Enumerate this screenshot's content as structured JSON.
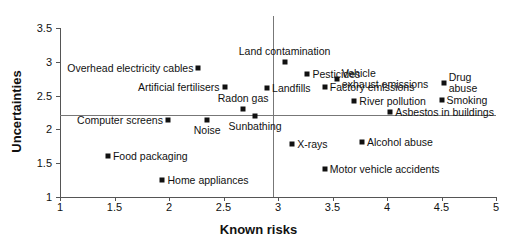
{
  "chart_data": {
    "type": "scatter",
    "title": "",
    "xlabel": "Known risks",
    "ylabel": "Uncertainties",
    "xlim": [
      1,
      5
    ],
    "ylim": [
      1,
      3.5
    ],
    "xticks": [
      "1",
      "1.5",
      "2",
      "2.5",
      "3",
      "3.5",
      "4",
      "4.5",
      "5"
    ],
    "xtick_values": [
      1,
      1.5,
      2,
      2.5,
      3,
      3.5,
      4,
      4.5,
      5
    ],
    "yticks": [
      "1",
      "1.5",
      "2",
      "2.5",
      "3",
      "3.5"
    ],
    "ytick_values": [
      1,
      1.5,
      2,
      2.5,
      3,
      3.5
    ],
    "grid": false,
    "legend": "none",
    "reference_lines": [
      {
        "orientation": "horizontal",
        "value": 2.21,
        "label": ""
      },
      {
        "orientation": "vertical",
        "value": 2.95,
        "label": ""
      }
    ],
    "points": [
      {
        "label": "Overhead electricity cables",
        "x": 2.27,
        "y": 2.91,
        "label_pos": "left"
      },
      {
        "label": "Artificial fertilisers",
        "x": 2.51,
        "y": 2.63,
        "label_pos": "left"
      },
      {
        "label": "Radon gas",
        "x": 2.68,
        "y": 2.3,
        "label_pos": "above"
      },
      {
        "label": "Sunbathing",
        "x": 2.79,
        "y": 2.2,
        "label_pos": "below"
      },
      {
        "label": "Computer screens",
        "x": 1.99,
        "y": 2.14,
        "label_pos": "left"
      },
      {
        "label": "Noise",
        "x": 2.35,
        "y": 2.14,
        "label_pos": "below"
      },
      {
        "label": "Food packaging",
        "x": 1.44,
        "y": 1.6,
        "label_pos": "right"
      },
      {
        "label": "Home appliances",
        "x": 1.94,
        "y": 1.25,
        "label_pos": "right"
      },
      {
        "label": "Land contamination",
        "x": 3.06,
        "y": 3.0,
        "label_pos": "above"
      },
      {
        "label": "Pesticides",
        "x": 3.27,
        "y": 2.82,
        "label_pos": "right"
      },
      {
        "label": "Vehicle exhaust emissions",
        "x": 3.54,
        "y": 2.74,
        "label_pos": "right-two"
      },
      {
        "label": "Drug abuse",
        "x": 4.52,
        "y": 2.68,
        "label_pos": "right-two"
      },
      {
        "label": "Landfills",
        "x": 2.9,
        "y": 2.61,
        "label_pos": "right"
      },
      {
        "label": "Factory emissions",
        "x": 3.43,
        "y": 2.62,
        "label_pos": "right"
      },
      {
        "label": "River pollution",
        "x": 3.7,
        "y": 2.42,
        "label_pos": "right"
      },
      {
        "label": "Smoking",
        "x": 4.5,
        "y": 2.44,
        "label_pos": "right"
      },
      {
        "label": "Asbestos in buildings",
        "x": 4.03,
        "y": 2.26,
        "label_pos": "right"
      },
      {
        "label": "X-rays",
        "x": 3.13,
        "y": 1.78,
        "label_pos": "right"
      },
      {
        "label": "Alcohol abuse",
        "x": 3.77,
        "y": 1.81,
        "label_pos": "right"
      },
      {
        "label": "Motor vehicle accidents",
        "x": 3.43,
        "y": 1.42,
        "label_pos": "right"
      }
    ]
  }
}
